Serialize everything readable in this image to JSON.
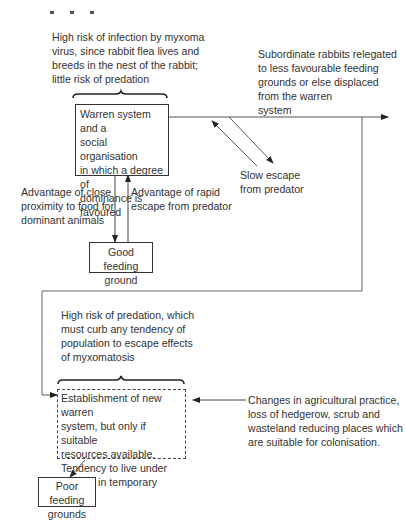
{
  "diagram": {
    "title_fragment": "",
    "nodes": {
      "infection_risk_note": {
        "text": "High risk of infection  by myxoma\nvirus, since rabbit flea lives and\nbreeds in the nest of the rabbit;\nlittle risk of predation"
      },
      "warren_system": {
        "text": "Warren system and a\nsocial organisation\nin which a degree of\ndominance is\nfavoured"
      },
      "subordinate_note": {
        "text": "Subordinate rabbits relegated\nto less favourable feeding\ngrounds or else displaced\nfrom the warren\nsystem"
      },
      "slow_escape": {
        "text": "Slow escape\nfrom predator"
      },
      "close_proximity": {
        "text": "Advantage of close\nproximity to food for\ndominant animals"
      },
      "rapid_escape": {
        "text": "Advantage of rapid\nescape from predator"
      },
      "good_feeding": {
        "text": "Good feeding\nground"
      },
      "predation_risk_note": {
        "text": "High risk of predation, which\nmust curb any tendency of\npopulation to escape effects\nof myxomatosis"
      },
      "new_warren": {
        "text": "Establishment of new warren\nsystem, but only if suitable\nresources available.\nTendency to live under\nbushes in temporary stops."
      },
      "agri_changes": {
        "text": "Changes in agricultural practice,\nloss of hedgerow, scrub and\nwasteland reducing places which\nare suitable for colonisation."
      },
      "poor_feeding": {
        "text": "Poor feeding\ngrounds"
      }
    },
    "colors": {
      "line": "#333333",
      "text": "#333333",
      "background": "#ffffff"
    }
  }
}
